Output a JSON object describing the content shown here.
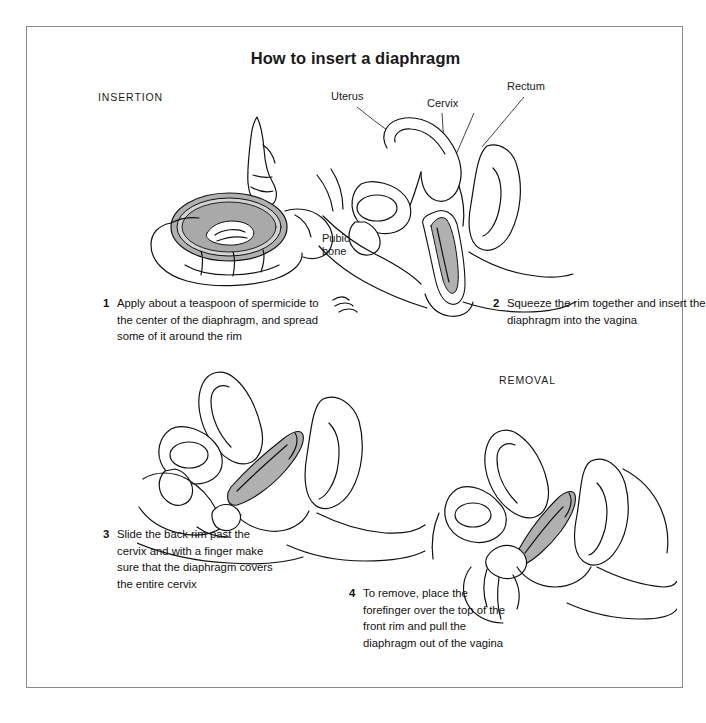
{
  "page": {
    "title": "How to insert a diaphragm",
    "border_color": "#8a8a8a",
    "background": "#ffffff",
    "diaphragm_fill": "#b0b0b0",
    "line_color": "#111111"
  },
  "sections": {
    "insertion_label": "INSERTION",
    "removal_label": "REMOVAL"
  },
  "anatomy_labels": [
    {
      "name": "uterus",
      "text": "Uterus"
    },
    {
      "name": "cervix",
      "text": "Cervix"
    },
    {
      "name": "rectum",
      "text": "Rectum"
    },
    {
      "name": "pubic-bone",
      "line1": "Pubic",
      "line2": "bone"
    }
  ],
  "steps": [
    {
      "number": "1",
      "text": "Apply about a teaspoon of spermicide to the center of the diaphragm, and spread some of it around the rim"
    },
    {
      "number": "2",
      "text": "Squeeze the rim together and insert the diaphragm into the vagina"
    },
    {
      "number": "3",
      "text": "Slide the back rim past the cervix and with a finger make sure that the diaphragm covers the entire cervix"
    },
    {
      "number": "4",
      "text": "To remove, place the forefinger over the top of the front rim and pull the diaphragm out of the vagina"
    }
  ],
  "illustrations": [
    {
      "name": "hand-holding-diaphragm-with-spermicide-tube",
      "step": "1"
    },
    {
      "name": "pelvic-cross-section-inserting-folded-diaphragm",
      "step": "2"
    },
    {
      "name": "pelvic-cross-section-checking-diaphragm-over-cervix",
      "step": "3"
    },
    {
      "name": "pelvic-cross-section-removing-diaphragm-with-finger",
      "step": "4"
    }
  ]
}
